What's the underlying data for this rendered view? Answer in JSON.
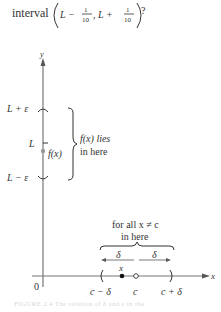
{
  "question": {
    "prefix": "interval",
    "expr_left": "L −",
    "frac_num": "1",
    "frac_den": "10",
    "expr_mid": ", L +",
    "suffix": "?"
  },
  "diagram": {
    "axes": {
      "x_label": "x",
      "y_label": "y",
      "origin_label": "0"
    },
    "y_axis_labels": {
      "upper": "L + ε",
      "center": "L",
      "lower": "L − ε"
    },
    "point_label": "f(x)",
    "brace_vertical_text": [
      "f(x) lies",
      "in here"
    ],
    "brace_horizontal_text": [
      "for all x ≠ c",
      "in here"
    ],
    "delta_left": "δ",
    "delta_right": "δ",
    "x_point_label": "x",
    "x_axis_labels": {
      "left": "c − δ",
      "center": "c",
      "right": "c + δ"
    },
    "colors": {
      "axis": "#777777",
      "text": "#333333",
      "point": "#999999"
    }
  },
  "caption": "FIGURE 2.4 The relation of δ and ε in the"
}
